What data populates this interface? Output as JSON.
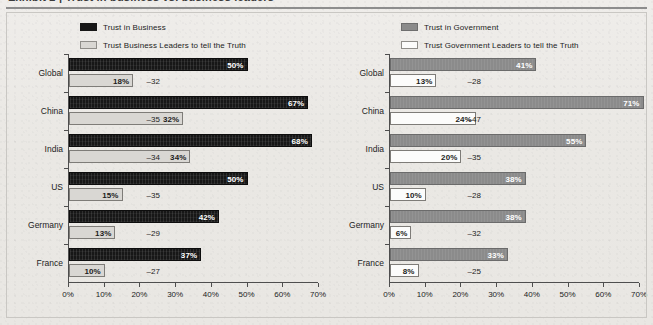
{
  "figure": {
    "title_sliver": "Exhibit 2 | Trust in business vs. business leaders",
    "background_hex": "#eceae6"
  },
  "axis": {
    "ticks": [
      "0%",
      "10%",
      "20%",
      "30%",
      "40%",
      "50%",
      "60%",
      "70%"
    ],
    "min": 0,
    "max": 70,
    "step": 10
  },
  "categories": [
    "Global",
    "China",
    "India",
    "US",
    "Germany",
    "France"
  ],
  "colors": {
    "business_institution": "#171717",
    "business_leaders": "#d9d7d3",
    "government_institution": "#8b8b8b",
    "government_leaders": "#fcfcfb",
    "axis": "#4e4e4e",
    "rule": "#8d8d8d"
  },
  "chart_data": [
    {
      "type": "bar",
      "id": "business",
      "title": "",
      "xlabel": "",
      "ylabel": "",
      "orientation": "horizontal",
      "xlim": [
        0,
        70
      ],
      "grid": false,
      "legend_position": "top",
      "categories": [
        "Global",
        "China",
        "India",
        "US",
        "Germany",
        "France"
      ],
      "series": [
        {
          "name": "Trust in Business",
          "color": "#171717",
          "values": [
            50,
            67,
            68,
            50,
            42,
            37
          ],
          "labels": [
            "50%",
            "67%",
            "68%",
            "50%",
            "42%",
            "37%"
          ]
        },
        {
          "name": "Trust Business Leaders to tell the Truth",
          "color": "#d9d7d3",
          "values": [
            18,
            32,
            34,
            15,
            13,
            10
          ],
          "labels": [
            "18%",
            "32%",
            "34%",
            "15%",
            "13%",
            "10%"
          ]
        }
      ],
      "annotations": {
        "name": "gap",
        "values": [
          -32,
          -35,
          -34,
          -35,
          -29,
          -27
        ],
        "labels": [
          "–32",
          "–35",
          "–34",
          "–35",
          "–29",
          "–27"
        ]
      }
    },
    {
      "type": "bar",
      "id": "government",
      "title": "",
      "xlabel": "",
      "ylabel": "",
      "orientation": "horizontal",
      "xlim": [
        0,
        70
      ],
      "grid": false,
      "legend_position": "top",
      "categories": [
        "Global",
        "China",
        "India",
        "US",
        "Germany",
        "France"
      ],
      "series": [
        {
          "name": "Trust in Government",
          "color": "#8b8b8b",
          "values": [
            41,
            71,
            55,
            38,
            38,
            33
          ],
          "labels": [
            "41%",
            "71%",
            "55%",
            "38%",
            "38%",
            "33%"
          ]
        },
        {
          "name": "Trust Government Leaders to tell the Truth",
          "color": "#fcfcfb",
          "values": [
            13,
            24,
            20,
            10,
            6,
            8
          ],
          "labels": [
            "13%",
            "24%",
            "20%",
            "10%",
            "6%",
            "8%"
          ]
        }
      ],
      "annotations": {
        "name": "gap",
        "values": [
          -28,
          -47,
          -35,
          -28,
          -32,
          -25
        ],
        "labels": [
          "–28",
          "–47",
          "–35",
          "–28",
          "–32",
          "–25"
        ]
      }
    }
  ]
}
